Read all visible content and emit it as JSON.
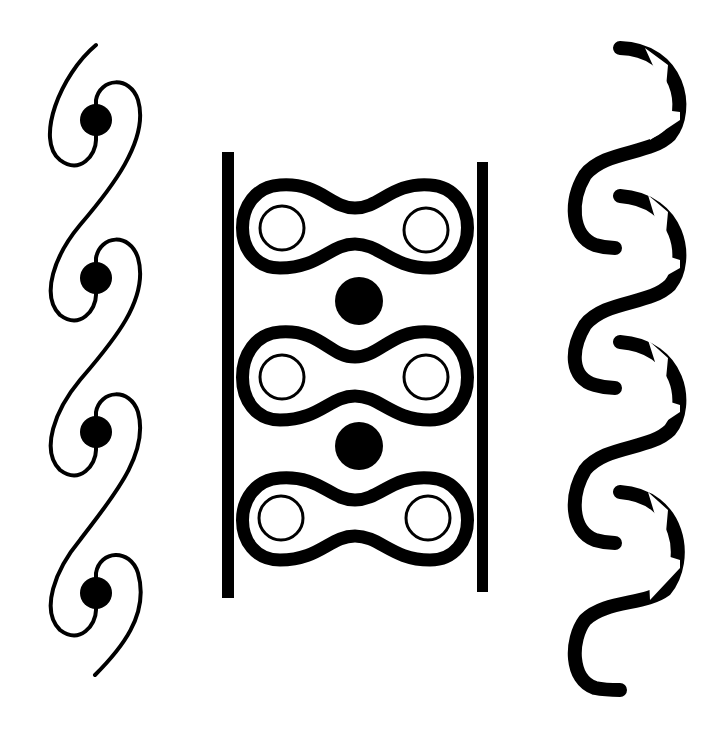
{
  "figure": {
    "colors": {
      "ink": "#000000",
      "paper": "#ffffff"
    },
    "left_pattern": {
      "name": "spiral-scroll-with-dots",
      "repeats": 4,
      "dot_centers_y": [
        120,
        278,
        432,
        593
      ],
      "dot_center_x": 96
    },
    "middle_pattern": {
      "name": "chain-links-between-rails",
      "links": 3,
      "link_centers_y": [
        220,
        378,
        517
      ],
      "filled_dots_y": [
        300,
        446
      ],
      "rail_left_x": 228,
      "rail_right_x": 482
    },
    "right_pattern": {
      "name": "bold-s-wave",
      "repeats": 4
    }
  }
}
